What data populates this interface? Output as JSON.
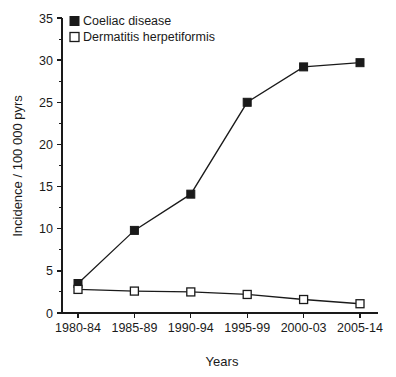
{
  "chart_data": {
    "type": "line",
    "title": "",
    "xlabel": "Years",
    "ylabel": "Incidence / 100 000 pyrs",
    "categories": [
      "1980-84",
      "1985-89",
      "1990-94",
      "1995-99",
      "2000-03",
      "2005-14"
    ],
    "series": [
      {
        "name": "Coeliac disease",
        "marker": "filled-square",
        "color": "#1a1a1a",
        "values": [
          3.5,
          9.8,
          14.1,
          25.0,
          29.2,
          29.7
        ]
      },
      {
        "name": "Dermatitis herpetiformis",
        "marker": "open-square",
        "color": "#1a1a1a",
        "values": [
          2.8,
          2.6,
          2.5,
          2.2,
          1.6,
          1.1
        ]
      }
    ],
    "ylim": [
      0,
      35
    ],
    "yticks": [
      0,
      5,
      10,
      15,
      20,
      25,
      30,
      35
    ],
    "ytick_labels": [
      "0",
      "5",
      "10",
      "15",
      "20",
      "25",
      "30",
      "35"
    ],
    "y_minor_step": 2.5,
    "grid": false,
    "legend_position": "top-left"
  },
  "legend": {
    "entries": [
      {
        "label": "Coeliac disease",
        "marker": "filled-square"
      },
      {
        "label": "Dermatitis herpetiformis",
        "marker": "open-square"
      }
    ]
  }
}
